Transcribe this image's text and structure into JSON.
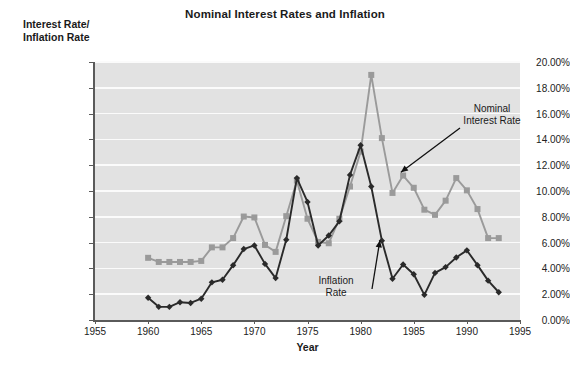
{
  "chart_data": {
    "type": "line",
    "title": "Nominal Interest Rates and Inflation",
    "xlabel": "Year",
    "ylabel": "Interest Rate/ Inflation Rate",
    "ylabel_line1": "Interest Rate/",
    "ylabel_line2": "Inflation Rate",
    "xlim": [
      1955,
      1995
    ],
    "ylim": [
      0,
      20
    ],
    "grid": true,
    "legend_position": "inline-annotations",
    "x_tick_labels": [
      "1955",
      "1960",
      "1965",
      "1970",
      "1975",
      "1980",
      "1985",
      "1990",
      "1995"
    ],
    "x_ticks": [
      1955,
      1960,
      1965,
      1970,
      1975,
      1980,
      1985,
      1990,
      1995
    ],
    "y_tick_labels": [
      "0.00%",
      "2.00%",
      "4.00%",
      "6.00%",
      "8.00%",
      "10.00%",
      "12.00%",
      "14.00%",
      "16.00%",
      "18.00%",
      "20.00%"
    ],
    "y_ticks": [
      0,
      2,
      4,
      6,
      8,
      10,
      12,
      14,
      16,
      18,
      20
    ],
    "x": [
      1960,
      1961,
      1962,
      1963,
      1964,
      1965,
      1966,
      1967,
      1968,
      1969,
      1970,
      1971,
      1972,
      1973,
      1974,
      1975,
      1976,
      1977,
      1978,
      1979,
      1980,
      1981,
      1982,
      1983,
      1984,
      1985,
      1986,
      1987,
      1988,
      1989,
      1990,
      1991,
      1992,
      1993
    ],
    "series": [
      {
        "name": "Nominal Interest Rate",
        "color": "#9a9a9a",
        "marker": "square",
        "values": [
          4.82,
          4.5,
          4.5,
          4.5,
          4.5,
          4.58,
          5.63,
          5.63,
          6.35,
          8.02,
          7.95,
          5.82,
          5.28,
          8.05,
          10.8,
          7.85,
          6.05,
          5.95,
          7.85,
          10.35,
          13.05,
          19.0,
          14.1,
          9.85,
          11.2,
          10.25,
          8.55,
          8.15,
          9.25,
          11.0,
          10.05,
          8.6,
          6.35,
          6.35
        ]
      },
      {
        "name": "Inflation Rate",
        "color": "#2a2a2a",
        "marker": "diamond",
        "values": [
          1.72,
          1.02,
          1.02,
          1.38,
          1.32,
          1.65,
          2.92,
          3.12,
          4.25,
          5.5,
          5.78,
          4.35,
          3.25,
          6.22,
          11.0,
          9.15,
          5.78,
          6.55,
          7.65,
          11.25,
          13.55,
          10.35,
          6.15,
          3.2,
          4.3,
          3.55,
          1.95,
          3.65,
          4.1,
          4.85,
          5.4,
          4.25,
          3.05,
          2.15
        ]
      }
    ],
    "annotations": [
      {
        "id": "nominal",
        "text_line1": "Nominal",
        "text_line2": "Interest Rate",
        "points_to_year": 1984,
        "points_to_value": 11.2
      },
      {
        "id": "inflation",
        "text_line1": "Inflation",
        "text_line2": "Rate",
        "points_to_year": 1982,
        "points_to_value": 6.15
      }
    ],
    "colors": {
      "plot_background": "#e2e2e2",
      "gridline": "#fbfbfb",
      "axis": "#5a5a5a",
      "page_background": "#ffffff",
      "text": "#1a1a1a",
      "nominal_series": "#9a9a9a",
      "inflation_series": "#2a2a2a"
    }
  }
}
